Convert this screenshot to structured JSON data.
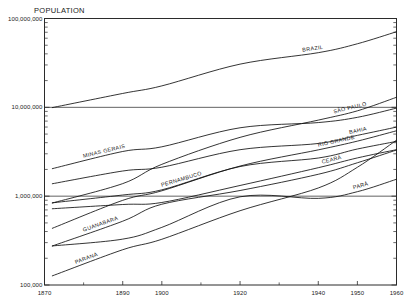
{
  "chart_data": {
    "type": "line",
    "title": "POPULATION",
    "xlabel": "",
    "ylabel": "POPULATION",
    "yscale": "log",
    "ylim": [
      100000,
      100000000
    ],
    "xlim": [
      1870,
      1960
    ],
    "grid": true,
    "grid_lines_y": [
      10000000,
      1000000
    ],
    "legend_position": "inline-labels",
    "y_tick_labels": [
      "100,000,000",
      "10,000,000",
      "1,000,000",
      "100,000"
    ],
    "y_tick_values": [
      100000000,
      10000000,
      1000000,
      100000
    ],
    "x_tick_labels": [
      "1870",
      "1890",
      "1900",
      "1920",
      "1940",
      "1950",
      "1960"
    ],
    "x_tick_values": [
      1870,
      1890,
      1900,
      1920,
      1940,
      1950,
      1960
    ],
    "x_minor_ticks": [
      1880,
      1910,
      1930
    ],
    "series": [
      {
        "name": "BRAZIL",
        "label": "BRAZIL",
        "x": [
          1872,
          1890,
          1900,
          1920,
          1940,
          1950,
          1960
        ],
        "values": [
          9930478,
          14333915,
          17438434,
          30635605,
          41236315,
          51944397,
          70992343
        ]
      },
      {
        "name": "SÃO PAULO",
        "label": "SÃO PAULO",
        "x": [
          1872,
          1890,
          1900,
          1920,
          1940,
          1950,
          1960
        ],
        "values": [
          837354,
          1384753,
          2282279,
          4592188,
          7180316,
          9134423,
          12974699
        ]
      },
      {
        "name": "MINAS GERAIS",
        "label": "MINAS GERAIS",
        "x": [
          1872,
          1890,
          1900,
          1920,
          1940,
          1950,
          1960
        ],
        "values": [
          2039735,
          3184099,
          3594471,
          5888174,
          6736416,
          7717792,
          9798880
        ]
      },
      {
        "name": "BAHIA",
        "label": "BAHIA",
        "x": [
          1872,
          1890,
          1900,
          1920,
          1940,
          1950,
          1960
        ],
        "values": [
          1379616,
          1919802,
          2117956,
          3334465,
          3918112,
          4834575,
          5990605
        ]
      },
      {
        "name": "RIO GRANDE",
        "label": "RIO GRANDE",
        "x": [
          1872,
          1890,
          1900,
          1920,
          1940,
          1950,
          1960
        ],
        "values": [
          434813,
          897455,
          1149070,
          2182713,
          3320689,
          4164821,
          5448823
        ]
      },
      {
        "name": "PERNAMBUCO",
        "label": "PERNAMBUCO",
        "x": [
          1872,
          1890,
          1900,
          1920,
          1940,
          1950,
          1960
        ],
        "values": [
          841539,
          1030224,
          1178150,
          2154835,
          2688240,
          3395185,
          4136900
        ]
      },
      {
        "name": "CEARÁ",
        "label": "CEARÁ",
        "x": [
          1872,
          1890,
          1900,
          1920,
          1940,
          1950,
          1960
        ],
        "values": [
          721686,
          805687,
          849127,
          1319228,
          2091032,
          2695450,
          3337856
        ]
      },
      {
        "name": "PARÁ",
        "label": "PARÁ",
        "x": [
          1872,
          1890,
          1900,
          1920,
          1940,
          1950,
          1960
        ],
        "values": [
          275237,
          328455,
          445356,
          983507,
          944644,
          1123273,
          1550935
        ]
      },
      {
        "name": "GUANABARA",
        "label": "GUANABARA",
        "x": [
          1872,
          1890,
          1900,
          1920,
          1940,
          1950,
          1960
        ],
        "values": [
          274972,
          522651,
          811443,
          1157873,
          1764141,
          2377451,
          3307163
        ]
      },
      {
        "name": "PARANÁ",
        "label": "PARANÁ",
        "x": [
          1872,
          1890,
          1900,
          1920,
          1940,
          1950,
          1960
        ],
        "values": [
          126722,
          249491,
          327136,
          685711,
          1236276,
          2115547,
          4268239
        ]
      }
    ]
  }
}
